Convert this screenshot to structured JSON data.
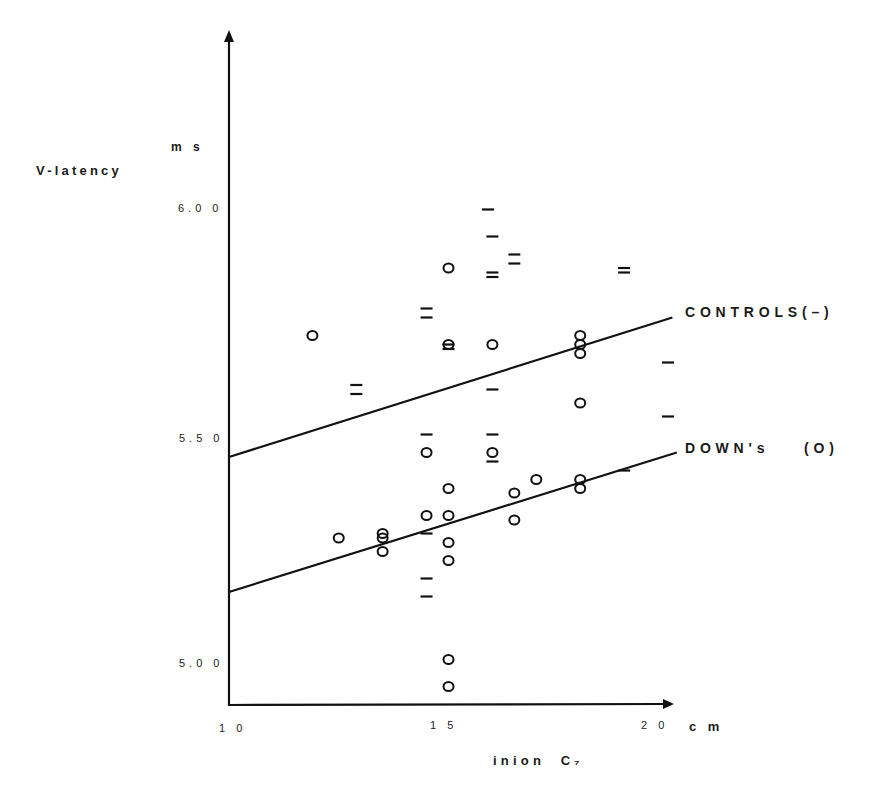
{
  "chart_data": {
    "type": "scatter",
    "title": "",
    "xlabel": "inion C7",
    "xunit": "cm",
    "ylabel": "V-latency",
    "yunit": "ms",
    "xlim": [
      10,
      20
    ],
    "ylim": [
      4.9,
      6.35
    ],
    "x_ticks": [
      "10",
      "15",
      "20"
    ],
    "y_ticks": [
      "5.00",
      "5.50",
      "6.00"
    ],
    "grid": false,
    "legend": [
      {
        "label": "CONTROLS(–)",
        "marker": "dash",
        "position": "right of regression line end"
      },
      {
        "label": "DOWN's",
        "marker_label": "(O)",
        "marker": "circle",
        "position": "right of regression line end"
      }
    ],
    "series": [
      {
        "name": "Controls",
        "marker": "dash",
        "points": [
          [
            12.9,
            5.62
          ],
          [
            12.9,
            5.6
          ],
          [
            14.5,
            5.79
          ],
          [
            14.5,
            5.77
          ],
          [
            14.5,
            5.51
          ],
          [
            14.5,
            5.29
          ],
          [
            14.5,
            5.19
          ],
          [
            14.5,
            5.15
          ],
          [
            15.0,
            5.71
          ],
          [
            15.0,
            5.7
          ],
          [
            15.9,
            6.01
          ],
          [
            16.0,
            5.95
          ],
          [
            16.0,
            5.87
          ],
          [
            16.0,
            5.86
          ],
          [
            16.0,
            5.61
          ],
          [
            16.0,
            5.51
          ],
          [
            16.0,
            5.45
          ],
          [
            16.5,
            5.91
          ],
          [
            16.5,
            5.89
          ],
          [
            19.0,
            5.88
          ],
          [
            19.0,
            5.87
          ],
          [
            19.0,
            5.43
          ],
          [
            20.0,
            5.67
          ],
          [
            20.0,
            5.55
          ]
        ],
        "regression": {
          "x": [
            10,
            20.1
          ],
          "y": [
            5.46,
            5.77
          ]
        }
      },
      {
        "name": "Down's",
        "marker": "circle",
        "points": [
          [
            11.9,
            5.73
          ],
          [
            12.5,
            5.28
          ],
          [
            13.5,
            5.29
          ],
          [
            13.5,
            5.28
          ],
          [
            13.5,
            5.25
          ],
          [
            14.5,
            5.47
          ],
          [
            14.5,
            5.33
          ],
          [
            15.0,
            5.88
          ],
          [
            15.0,
            5.71
          ],
          [
            15.0,
            5.39
          ],
          [
            15.0,
            5.33
          ],
          [
            15.0,
            5.27
          ],
          [
            15.0,
            5.23
          ],
          [
            15.0,
            5.01
          ],
          [
            15.0,
            4.95
          ],
          [
            16.0,
            5.71
          ],
          [
            16.0,
            5.47
          ],
          [
            16.5,
            5.38
          ],
          [
            16.5,
            5.32
          ],
          [
            17.0,
            5.41
          ],
          [
            18.0,
            5.73
          ],
          [
            18.0,
            5.71
          ],
          [
            18.0,
            5.69
          ],
          [
            18.0,
            5.58
          ],
          [
            18.0,
            5.41
          ],
          [
            18.0,
            5.39
          ]
        ],
        "regression": {
          "x": [
            10,
            20.2
          ],
          "y": [
            5.16,
            5.47
          ]
        }
      }
    ]
  },
  "labels": {
    "ylabel": "V-latency",
    "yunit": "m s",
    "xlabel": "inion  C₇",
    "xunit": "c m",
    "tick_x_10": "1 0",
    "tick_x_15": "1 5",
    "tick_x_20": "2 0",
    "tick_y_600": "6.0 0",
    "tick_y_550": "5.5 0",
    "tick_y_500": "5.0 0",
    "legend_controls": "CONTROLS(–)",
    "legend_downs": "DOWN's    (O)"
  },
  "style": {
    "ink": "#111111",
    "background": "#ffffff"
  }
}
